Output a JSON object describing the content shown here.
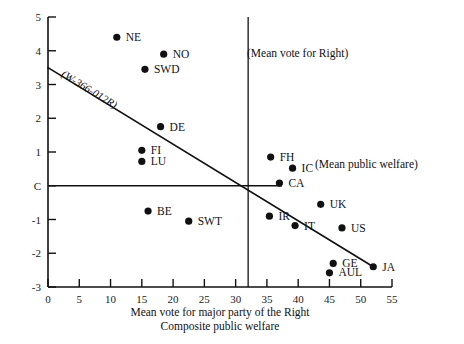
{
  "chart_data": {
    "type": "scatter",
    "title": "",
    "xlabel": "Mean vote for major party of the Right",
    "xlabel2": "Composite public welfare",
    "ylabel": "",
    "xlim": [
      0,
      55
    ],
    "ylim": [
      -3,
      5
    ],
    "xticks": [
      "0",
      "5",
      "10",
      "15",
      "20",
      "25",
      "30",
      "35",
      "40",
      "45",
      "50",
      "55"
    ],
    "yticks": [
      "5",
      "4",
      "3",
      "2",
      "1",
      "C",
      "-1",
      "-2",
      "-3"
    ],
    "grid": false,
    "legend": "none",
    "points": [
      {
        "label": "NE",
        "x": 11.0,
        "y": 4.4,
        "lx": 9,
        "ly": 4
      },
      {
        "label": "NO",
        "x": 18.5,
        "y": 3.9,
        "lx": 9,
        "ly": 4
      },
      {
        "label": "SWD",
        "x": 15.5,
        "y": 3.45,
        "lx": 9,
        "ly": 4
      },
      {
        "label": "DE",
        "x": 18.0,
        "y": 1.75,
        "lx": 9,
        "ly": 4
      },
      {
        "label": "FI",
        "x": 15.0,
        "y": 1.05,
        "lx": 9,
        "ly": 4
      },
      {
        "label": "LU",
        "x": 15.0,
        "y": 0.72,
        "lx": 9,
        "ly": 4
      },
      {
        "label": "FH",
        "x": 35.6,
        "y": 0.85,
        "lx": 9,
        "ly": 4
      },
      {
        "label": "IC",
        "x": 39.1,
        "y": 0.52,
        "lx": 9,
        "ly": 4
      },
      {
        "label": "CA",
        "x": 37.0,
        "y": 0.08,
        "lx": 9,
        "ly": 4
      },
      {
        "label": "BE",
        "x": 16.0,
        "y": -0.75,
        "lx": 9,
        "ly": 4
      },
      {
        "label": "SWT",
        "x": 22.5,
        "y": -1.05,
        "lx": 9,
        "ly": 4
      },
      {
        "label": "IR",
        "x": 35.4,
        "y": -0.9,
        "lx": 9,
        "ly": 4
      },
      {
        "label": "IT",
        "x": 39.5,
        "y": -1.18,
        "lx": 9,
        "ly": 4
      },
      {
        "label": "UK",
        "x": 43.6,
        "y": -0.55,
        "lx": 9,
        "ly": 4
      },
      {
        "label": "US",
        "x": 47.0,
        "y": -1.25,
        "lx": 9,
        "ly": 4
      },
      {
        "label": "GE",
        "x": 45.6,
        "y": -2.3,
        "lx": 9,
        "ly": 4
      },
      {
        "label": "AUL",
        "x": 45.0,
        "y": -2.58,
        "lx": 9,
        "ly": 3
      },
      {
        "label": "JA",
        "x": 52.0,
        "y": -2.4,
        "lx": 9,
        "ly": 4
      }
    ],
    "regression_line": {
      "label": "(W-366-012R)",
      "x0": 0.0,
      "y0": 3.5,
      "x1": 52.0,
      "y1": -2.4
    },
    "mean_vertical_line": {
      "label": "(Mean vote for Right)",
      "x": 32.0
    },
    "mean_horizontal_line": {
      "label": "(Mean public welfare)",
      "y": 0.0
    }
  }
}
